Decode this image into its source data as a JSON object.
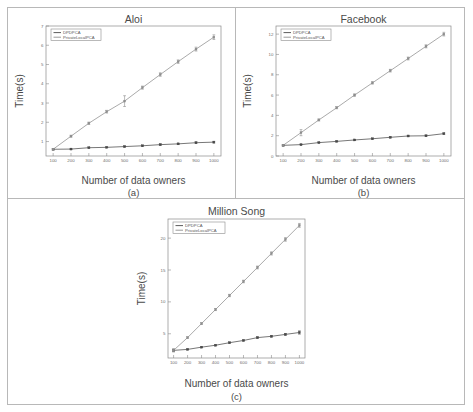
{
  "figure": {
    "background": "#ffffff",
    "frame_color": "#b8b8b8",
    "axis_color": "#8a8a8a",
    "xlabel": "Number of data owners",
    "ylabel": "Time(s)",
    "series_colors": {
      "dpdpca": "#4a4a4a",
      "privatelocalpca": "#8e8e8e"
    }
  },
  "chart_data": [
    {
      "type": "line",
      "panel": "a",
      "title": "Aloi",
      "caption": "(a)",
      "xlabel": "Number of data owners",
      "ylabel": "Time(s)",
      "x": [
        100,
        200,
        300,
        400,
        500,
        600,
        700,
        800,
        900,
        1000
      ],
      "xlim": [
        60,
        1040
      ],
      "xticks": [
        100,
        200,
        300,
        400,
        500,
        600,
        700,
        800,
        900,
        1000
      ],
      "ylim": [
        0.25,
        7.0
      ],
      "yticks": [
        1,
        2,
        3,
        4,
        5,
        6,
        7
      ],
      "grid": false,
      "legend_position": "top-left",
      "series": [
        {
          "name": "DPDPCA",
          "color": "#4a4a4a",
          "values": [
            0.6,
            0.61,
            0.68,
            0.7,
            0.74,
            0.78,
            0.84,
            0.88,
            0.94,
            0.97
          ],
          "errors": [
            0.03,
            0.02,
            0.03,
            0.02,
            0.03,
            0.03,
            0.04,
            0.03,
            0.04,
            0.04
          ]
        },
        {
          "name": "PrivateLocalPCA",
          "color": "#8e8e8e",
          "values": [
            0.6,
            1.28,
            1.95,
            2.55,
            3.1,
            3.8,
            4.48,
            5.15,
            5.8,
            6.42
          ],
          "errors": [
            0.04,
            0.05,
            0.06,
            0.07,
            0.28,
            0.08,
            0.09,
            0.09,
            0.1,
            0.12
          ]
        }
      ]
    },
    {
      "type": "line",
      "panel": "b",
      "title": "Facebook",
      "caption": "(b)",
      "xlabel": "Number of data owners",
      "ylabel": "Time(s)",
      "x": [
        100,
        200,
        300,
        400,
        500,
        600,
        700,
        800,
        900,
        1000
      ],
      "xlim": [
        60,
        1040
      ],
      "xticks": [
        100,
        200,
        300,
        400,
        500,
        600,
        700,
        800,
        900,
        1000
      ],
      "ylim": [
        0,
        12.8
      ],
      "yticks": [
        0,
        2,
        4,
        6,
        8,
        10,
        12
      ],
      "grid": false,
      "legend_position": "top-left",
      "series": [
        {
          "name": "DPDPCA",
          "color": "#4a4a4a",
          "values": [
            1.05,
            1.12,
            1.32,
            1.44,
            1.58,
            1.7,
            1.84,
            1.97,
            1.99,
            2.2
          ],
          "errors": [
            0.05,
            0.04,
            0.05,
            0.05,
            0.05,
            0.05,
            0.06,
            0.06,
            0.06,
            0.07
          ]
        },
        {
          "name": "PrivateLocalPCA",
          "color": "#8e8e8e",
          "values": [
            1.05,
            2.3,
            3.55,
            4.75,
            6.0,
            7.2,
            8.4,
            9.6,
            10.8,
            12.0
          ],
          "errors": [
            0.06,
            0.3,
            0.1,
            0.1,
            0.12,
            0.12,
            0.13,
            0.14,
            0.15,
            0.18
          ]
        }
      ]
    },
    {
      "type": "line",
      "panel": "c",
      "title": "Million Song",
      "caption": "(c)",
      "xlabel": "Number of data owners",
      "ylabel": "Time(s)",
      "x": [
        100,
        200,
        300,
        400,
        500,
        600,
        700,
        800,
        900,
        1000
      ],
      "xlim": [
        60,
        1040
      ],
      "xticks": [
        100,
        200,
        300,
        400,
        500,
        600,
        700,
        800,
        900,
        1000
      ],
      "ylim": [
        1.2,
        23.0
      ],
      "yticks": [
        5,
        10,
        15,
        20
      ],
      "grid": false,
      "legend_position": "top-left",
      "series": [
        {
          "name": "DPDPCA",
          "color": "#4a4a4a",
          "values": [
            2.4,
            2.55,
            2.9,
            3.2,
            3.6,
            3.95,
            4.4,
            4.6,
            4.9,
            5.2
          ],
          "errors": [
            0.22,
            0.08,
            0.08,
            0.09,
            0.1,
            0.1,
            0.12,
            0.12,
            0.14,
            0.25
          ]
        },
        {
          "name": "PrivateLocalPCA",
          "color": "#8e8e8e",
          "values": [
            2.4,
            4.4,
            6.6,
            8.8,
            11.0,
            13.2,
            15.4,
            17.6,
            19.8,
            22.0
          ],
          "errors": [
            0.2,
            0.12,
            0.14,
            0.16,
            0.18,
            0.2,
            0.22,
            0.25,
            0.28,
            0.3
          ]
        }
      ]
    }
  ]
}
